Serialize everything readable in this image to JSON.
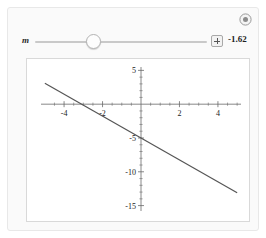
{
  "controls": {
    "slider": {
      "label": "m",
      "value_display": "-1.62",
      "value": -1.62,
      "min": -5,
      "max": 5,
      "thumb_fraction": 0.335,
      "increment_icon": "plus-icon"
    },
    "corner_icon": "plus-circle-icon"
  },
  "chart_data": {
    "type": "line",
    "title": "",
    "xlabel": "",
    "ylabel": "",
    "xlim": [
      -5.2,
      5.2
    ],
    "ylim": [
      -15.8,
      5.5
    ],
    "grid": false,
    "legend": null,
    "axes_style": "crossed-at-origin",
    "x_ticks_major": [
      -4,
      -2,
      2,
      4
    ],
    "x_tick_labels": [
      "-4",
      "-2",
      "2",
      "4"
    ],
    "x_ticks_minor": [
      -4.5,
      -3.5,
      -3,
      -2.5,
      -1.5,
      -1,
      -0.5,
      0.5,
      1,
      1.5,
      2.5,
      3,
      3.5,
      4.5,
      5
    ],
    "y_ticks_major": [
      5,
      -5,
      -10,
      -15
    ],
    "y_tick_labels": [
      "5",
      "-5",
      "-10",
      "-15"
    ],
    "y_ticks_minor": [
      4,
      3,
      2,
      1,
      -1,
      -2,
      -3,
      -4,
      -6,
      -7,
      -8,
      -9,
      -11,
      -12,
      -13,
      -14
    ],
    "series": [
      {
        "name": "y = m x - 5",
        "slope": -1.62,
        "intercept": -5,
        "color": "#555555",
        "x": [
          -5,
          5
        ],
        "y": [
          3.1,
          -13.1
        ],
        "x_intercept": -3.086
      }
    ]
  }
}
